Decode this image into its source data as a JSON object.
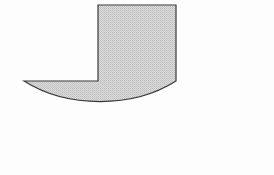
{
  "figure": {
    "name": "tee-shape-with-semielliptical-base",
    "canvas": {
      "width": 274,
      "height": 175,
      "background_color": "#fdfdfd"
    },
    "style": {
      "fill_color": "#d2d2d2",
      "fill_pattern": "halftone-dither",
      "fill_pattern_dot_color": "#b9b9b9",
      "stroke_color": "#3a3a3a",
      "stroke_width": 1.2
    },
    "parts": [
      {
        "name": "rectangular-stem",
        "shape": "rectangle",
        "x": 98,
        "y": 5,
        "width": 78,
        "height": 76,
        "left": 98,
        "right": 176,
        "top": 5,
        "bottom": 81
      },
      {
        "name": "semielliptical-base",
        "shape": "semi-ellipse",
        "center_x": 137,
        "center_y": 81,
        "radius_x": 113,
        "radius_y": 79,
        "left": 24,
        "right": 250,
        "top": 81,
        "bottom": 160,
        "orientation": "opening-upward-flat-top"
      }
    ],
    "outline_path": "M 98 5 L 176 5 L 176 81 A 113 79 0 0 1 24 81 L 98 81 Z",
    "labels": []
  }
}
